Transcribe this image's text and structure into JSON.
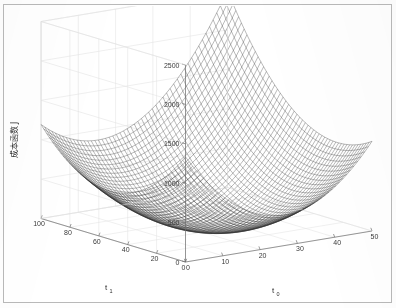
{
  "figure": {
    "kind": "matlab-3d-mesh-plot",
    "background_color": "#ffffff",
    "frame_color": "#b9b9b9",
    "mesh_color": "#2a2a2a",
    "grid_color": "#e2e2e2",
    "axis_color": "#6e6e6e"
  },
  "chart_data": {
    "type": "line",
    "plot_style": "3d-wireframe-mesh-surface",
    "title": "",
    "subtitle": "",
    "xlabel": "t",
    "xlabel_sub": "0",
    "ylabel": "t",
    "ylabel_sub": "1",
    "zlabel": "成本函数 J",
    "zlabel_text": "成本函数",
    "zlabel_symbol": "J",
    "grid": true,
    "legend": "none",
    "legend_position": "none",
    "xlim": [
      0,
      50
    ],
    "ylim": [
      0,
      100
    ],
    "zlim": [
      0,
      2500
    ],
    "xticks": [
      0,
      10,
      20,
      30,
      40,
      50
    ],
    "yticks": [
      0,
      20,
      40,
      60,
      80,
      100
    ],
    "zticks": [
      0,
      500,
      1000,
      1500,
      2000,
      2500
    ],
    "xtick_labels": [
      "0",
      "10",
      "20",
      "30",
      "40",
      "50"
    ],
    "ytick_labels": [
      "0",
      "20",
      "40",
      "60",
      "80",
      "100"
    ],
    "ztick_labels": [
      "0",
      "500",
      "1000",
      "1500",
      "2000",
      "2500"
    ],
    "y_axis_direction": "reversed",
    "surface_function": "convex quadratic bowl (paraboloid) cost surface J(t0,t1)",
    "minimum": {
      "t0": 22,
      "t1": 40,
      "J": 0
    },
    "mesh_rows": 52,
    "mesh_cols": 52,
    "view_azimuth": -37.5,
    "view_elevation": 30,
    "series": [
      {
        "name": "J(t0,t1)",
        "description": "quadratic bowl, z = a*(t0-22)^2 + b*(t1-40)^2 + c*(t0-22)*(t1-40)",
        "coef_a": 1.35,
        "coef_b": 0.26,
        "coef_cross": 0.3,
        "z_at_corners": {
          "t0_0_t1_0": 2040,
          "t0_0_t1_100": 1580,
          "t0_50_t1_0": 1700,
          "t0_50_t1_100": 2480
        }
      }
    ]
  },
  "axes": {
    "z": {
      "label": "成本函数 J",
      "ticks": [
        "2500",
        "2000",
        "1500",
        "1000",
        "500",
        "0"
      ]
    },
    "y": {
      "label_base": "t",
      "label_sub": "1",
      "ticks": [
        "100",
        "80",
        "60",
        "40",
        "20",
        "0"
      ]
    },
    "x": {
      "label_base": "t",
      "label_sub": "0",
      "ticks": [
        "0",
        "10",
        "20",
        "30",
        "40",
        "50"
      ]
    }
  }
}
